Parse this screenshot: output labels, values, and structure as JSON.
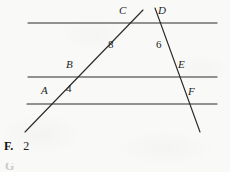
{
  "page": {
    "background_color": "#f9f9f8",
    "ink_color": "#1d1d1d",
    "width": 230,
    "height": 172
  },
  "figure": {
    "name": "three-parallel-lines-two-transversals",
    "stroke_color": "#2a2a2a",
    "parallel_lines": [
      {
        "id": "top-line",
        "x1": 28,
        "y1": 23,
        "x2": 217,
        "y2": 23
      },
      {
        "id": "middle-line",
        "x1": 28,
        "y1": 77,
        "x2": 217,
        "y2": 77
      },
      {
        "id": "bottom-line",
        "x1": 27,
        "y1": 104,
        "x2": 217,
        "y2": 104
      }
    ],
    "transversals": [
      {
        "id": "left-transversal",
        "x1": 143,
        "y1": 10,
        "x2": 25,
        "y2": 132
      },
      {
        "id": "right-transversal",
        "x1": 155,
        "y1": 8,
        "x2": 200,
        "y2": 132
      }
    ],
    "point_labels": [
      {
        "id": "point-A",
        "text": "A",
        "x": 41,
        "y": 90
      },
      {
        "id": "point-B",
        "text": "B",
        "x": 66,
        "y": 64
      },
      {
        "id": "point-C",
        "text": "C",
        "x": 119,
        "y": 10
      },
      {
        "id": "point-D",
        "text": "D",
        "x": 158,
        "y": 10
      },
      {
        "id": "point-E",
        "text": "E",
        "x": 178,
        "y": 64
      },
      {
        "id": "point-F",
        "text": "F",
        "x": 188,
        "y": 91
      }
    ],
    "segment_lengths": [
      {
        "id": "length-BC",
        "text": "8",
        "x": 108,
        "y": 44
      },
      {
        "id": "length-DE",
        "text": "6",
        "x": 156,
        "y": 44
      },
      {
        "id": "length-AB",
        "text": "4",
        "x": 66,
        "y": 83
      }
    ]
  },
  "answer_choice": {
    "letter": "F.",
    "value": "2"
  },
  "next_choice_partial": {
    "text": "G"
  }
}
